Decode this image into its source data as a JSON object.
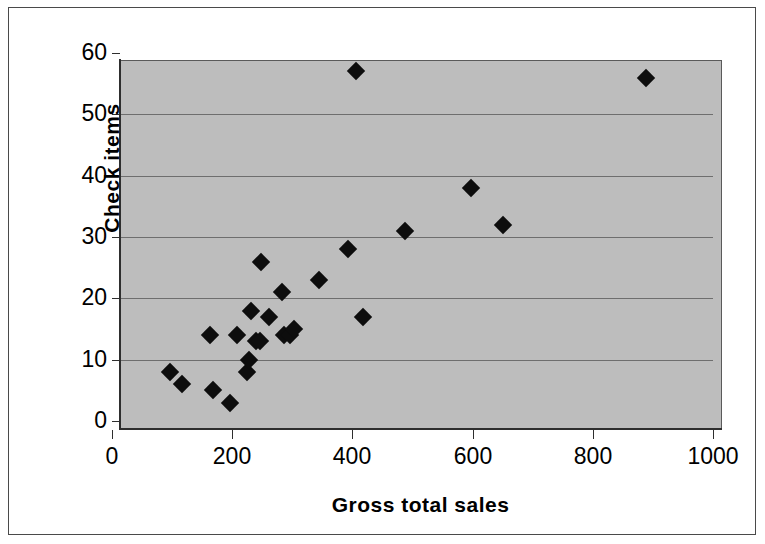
{
  "chart_data": {
    "type": "scatter",
    "title": "",
    "xlabel": "Gross total sales",
    "ylabel": "Check items",
    "xlim": [
      0,
      1000
    ],
    "ylim": [
      0,
      60
    ],
    "xticks": [
      "0",
      "200",
      "400",
      "600",
      "800",
      "1000"
    ],
    "yticks": [
      "0",
      "10",
      "20",
      "30",
      "40",
      "50",
      "60"
    ],
    "xtick_values": [
      0,
      200,
      400,
      600,
      800,
      1000
    ],
    "ytick_values": [
      0,
      10,
      20,
      30,
      40,
      50,
      60
    ],
    "grid": "horizontal",
    "legend": "none",
    "plot_background": "#bdbdbd",
    "marker_color": "#0d0d0d",
    "marker_shape": "diamond",
    "series": [
      {
        "name": "Stores",
        "points": [
          {
            "x": 96,
            "y": 8
          },
          {
            "x": 117,
            "y": 6
          },
          {
            "x": 163,
            "y": 14
          },
          {
            "x": 168,
            "y": 5
          },
          {
            "x": 196,
            "y": 3
          },
          {
            "x": 208,
            "y": 14
          },
          {
            "x": 224,
            "y": 8
          },
          {
            "x": 228,
            "y": 10
          },
          {
            "x": 232,
            "y": 18
          },
          {
            "x": 239,
            "y": 13
          },
          {
            "x": 246,
            "y": 13
          },
          {
            "x": 248,
            "y": 26
          },
          {
            "x": 262,
            "y": 17
          },
          {
            "x": 283,
            "y": 21
          },
          {
            "x": 286,
            "y": 14
          },
          {
            "x": 297,
            "y": 14
          },
          {
            "x": 303,
            "y": 15
          },
          {
            "x": 345,
            "y": 23
          },
          {
            "x": 392,
            "y": 28
          },
          {
            "x": 406,
            "y": 57
          },
          {
            "x": 418,
            "y": 17
          },
          {
            "x": 487,
            "y": 31
          },
          {
            "x": 597,
            "y": 38
          },
          {
            "x": 650,
            "y": 32
          },
          {
            "x": 888,
            "y": 56
          }
        ]
      }
    ]
  }
}
